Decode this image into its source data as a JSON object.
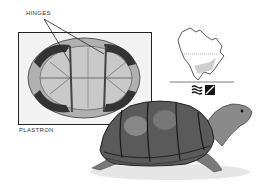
{
  "illustration": {
    "subject": "mud turtle",
    "labels": {
      "hinges": "HINGES",
      "plastron": "PLASTRON"
    },
    "range_map": {
      "region": "North America",
      "icons": [
        "water-habitat-icon",
        "land-habitat-icon"
      ]
    },
    "colors": {
      "ink": "#222222",
      "shell_dark": "#3a3a3a",
      "shell_mid": "#7a7a7a",
      "shell_light": "#b8b8b8",
      "plastron_fill": "#c9c9c9",
      "box_bg": "#f2f2f2",
      "map_range": "#cfcfcf"
    }
  }
}
